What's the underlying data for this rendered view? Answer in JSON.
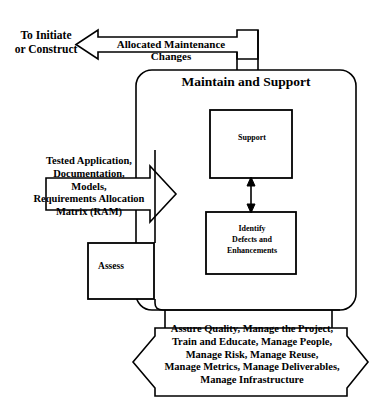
{
  "diagram": {
    "title_partial_cut_top": "",
    "external_ref": {
      "label": "To Initiate\nor Construct"
    },
    "top_arrow": {
      "label": "Allocated Maintenance Changes",
      "direction": "left"
    },
    "container": {
      "label": "Maintain and Support"
    },
    "nodes": [
      {
        "id": "support",
        "label": "Support"
      },
      {
        "id": "identify",
        "label": "Identify\nDefects and\nEnhancements"
      },
      {
        "id": "assess",
        "label": "Assess"
      }
    ],
    "output_arrow": {
      "label": "Tested Application,\nDocumentation,\nModels,\nRequirements Allocation\nMatrix (RAM)",
      "direction": "right"
    },
    "bottom_banner": {
      "label": "Assure Quality,  Manage the Project,\nTrain and Educate, Manage People,\nManage Risk, Manage Reuse,\nManage Metrics, Manage Deliverables,\nManage Infrastructure",
      "direction": "bidirectional"
    },
    "colors": {
      "stroke": "#000000",
      "background": "#ffffff",
      "text": "#000000"
    }
  }
}
